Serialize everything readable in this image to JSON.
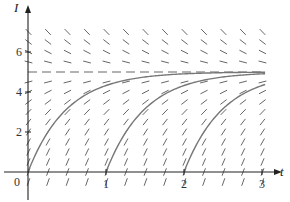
{
  "chart_data": {
    "type": "line",
    "title": "",
    "subtitle": "Slope field with solution curves approaching equilibrium I = 5",
    "xlabel": "t",
    "ylabel": "I",
    "xlim": [
      0,
      3.2
    ],
    "ylim": [
      -0.7,
      7.3
    ],
    "x_ticks": [
      {
        "value": 0,
        "label": "0"
      },
      {
        "value": 1,
        "label": "1"
      },
      {
        "value": 2,
        "label": "2"
      },
      {
        "value": 3,
        "label": "3"
      }
    ],
    "y_ticks": [
      {
        "value": 2,
        "label": "2"
      },
      {
        "value": 4,
        "label": "4"
      },
      {
        "value": 6,
        "label": "6"
      }
    ],
    "grid": false,
    "legend": null,
    "equilibrium": {
      "value": 5,
      "style": "dashed"
    },
    "slope_field": {
      "equation": "dI/dt = 2(5 - I)",
      "t_values": [
        0,
        0.25,
        0.5,
        0.75,
        1,
        1.25,
        1.5,
        1.75,
        2,
        2.25,
        2.5,
        2.75,
        3
      ],
      "I_values": [
        -0.5,
        0,
        0.5,
        1,
        1.5,
        2,
        2.5,
        3,
        3.5,
        4,
        4.5,
        5,
        5.5,
        6,
        6.5,
        7
      ]
    },
    "series": [
      {
        "name": "solution starting t=0",
        "start_t": 0,
        "x": [
          0,
          0.25,
          0.5,
          0.75,
          1,
          1.5,
          2,
          2.5,
          3
        ],
        "values": [
          0,
          1.97,
          3.16,
          3.88,
          4.32,
          4.75,
          4.91,
          4.97,
          4.99
        ]
      },
      {
        "name": "solution starting t=1",
        "start_t": 1,
        "x": [
          1,
          1.25,
          1.5,
          1.75,
          2,
          2.5,
          3
        ],
        "values": [
          0,
          1.97,
          3.16,
          3.88,
          4.32,
          4.75,
          4.91
        ]
      },
      {
        "name": "solution starting t=2",
        "start_t": 2,
        "x": [
          2,
          2.25,
          2.5,
          2.75,
          3,
          3.2
        ],
        "values": [
          0,
          1.97,
          3.16,
          3.88,
          4.32,
          4.55
        ]
      }
    ]
  },
  "axes": {
    "x_label": "t",
    "y_label": "I",
    "origin_label": "0"
  },
  "colors": {
    "axis": "#222222",
    "slope_marks": "#555555",
    "curves": "#777777",
    "equilibrium": "#666666"
  }
}
